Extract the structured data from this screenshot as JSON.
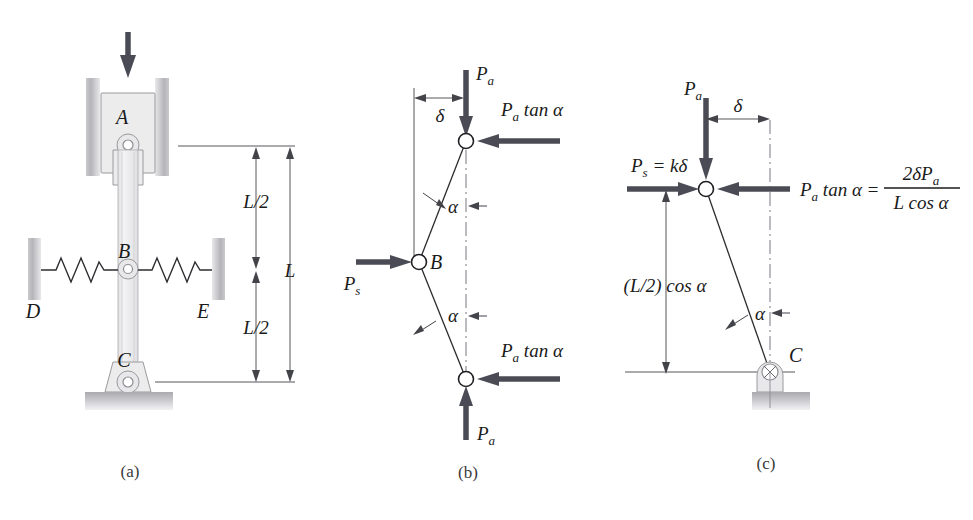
{
  "figure": {
    "panels": [
      {
        "id": "a",
        "label": "(a)"
      },
      {
        "id": "b",
        "label": "(b)"
      },
      {
        "id": "c",
        "label": "(c)"
      }
    ]
  },
  "panel_a": {
    "label": "(a)",
    "joints": [
      {
        "name": "A",
        "label": "A"
      },
      {
        "name": "B",
        "label": "B"
      },
      {
        "name": "C",
        "label": "C"
      }
    ],
    "wall_labels": [
      {
        "name": "D",
        "label": "D"
      },
      {
        "name": "E",
        "label": "E"
      }
    ],
    "dimensions": [
      {
        "name": "upper-half-length",
        "label": "L/2"
      },
      {
        "name": "lower-half-length",
        "label": "L/2"
      },
      {
        "name": "total-length",
        "label": "L"
      }
    ],
    "load_arrow": {
      "name": "applied-load-arrow",
      "direction": "down"
    },
    "springs": [
      {
        "name": "left-spring",
        "attached_to": "D"
      },
      {
        "name": "right-spring",
        "attached_to": "E"
      }
    ]
  },
  "panel_b": {
    "label": "(b)",
    "forces": [
      {
        "name": "top-axial-load",
        "label": "P",
        "sub": "a",
        "direction": "down"
      },
      {
        "name": "top-lateral-force",
        "label": "P",
        "sub": "a",
        "suffix": " tan α",
        "direction": "left"
      },
      {
        "name": "spring-force",
        "label": "P",
        "sub": "s",
        "direction": "right"
      },
      {
        "name": "bottom-lateral-force",
        "label": "P",
        "sub": "a",
        "suffix": " tan α",
        "direction": "left"
      },
      {
        "name": "bottom-axial-load",
        "label": "P",
        "sub": "a",
        "direction": "up"
      }
    ],
    "dimension_delta": "δ",
    "angles": [
      {
        "name": "upper-angle",
        "label": "α"
      },
      {
        "name": "lower-angle",
        "label": "α"
      }
    ],
    "joint_label": "B"
  },
  "panel_c": {
    "label": "(c)",
    "forces": [
      {
        "name": "axial-load",
        "label": "P",
        "sub": "a",
        "direction": "down"
      },
      {
        "name": "spring-force",
        "label": "P",
        "sub": "s",
        "suffix": " = kδ",
        "direction": "right"
      },
      {
        "name": "lateral-force",
        "label": "P",
        "sub": "a",
        "suffix": " tan α =",
        "direction": "left"
      }
    ],
    "equation": {
      "name": "lateral-force-equation",
      "lhs_base": "P",
      "lhs_sub": "a",
      "lhs_rest": " tan α =",
      "numerator_prefix": "2δP",
      "numerator_sub": "a",
      "denominator": "L cos α"
    },
    "dimension_delta": "δ",
    "dimension_height": "(L/2) cos α",
    "angle_label": "α",
    "support_label": "C"
  },
  "colors": {
    "arrow": "#4b4b55",
    "line": "#2c2c30",
    "dimension": "#43434a",
    "block_fill": "#ececed",
    "block_stroke": "#9a9a9e",
    "center_line": "#6a6a72",
    "background": "#ffffff"
  }
}
